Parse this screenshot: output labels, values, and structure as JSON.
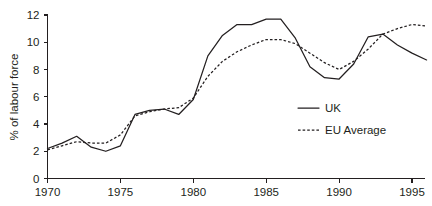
{
  "chart_data": {
    "type": "line",
    "title": "",
    "xlabel": "",
    "ylabel": "% of labour force",
    "xlim": [
      1970,
      1996
    ],
    "ylim": [
      0,
      12
    ],
    "grid": false,
    "legend_position": "center-right",
    "x_ticks": [
      "1970",
      "1975",
      "1980",
      "1985",
      "1990",
      "1995"
    ],
    "x_tick_values": [
      1970,
      1975,
      1980,
      1985,
      1990,
      1995
    ],
    "y_ticks": [
      "0",
      "2",
      "4",
      "6",
      "8",
      "10",
      "12"
    ],
    "y_tick_values": [
      0,
      2,
      4,
      6,
      8,
      10,
      12
    ],
    "x": [
      1970,
      1971,
      1972,
      1973,
      1974,
      1975,
      1976,
      1977,
      1978,
      1979,
      1980,
      1981,
      1982,
      1983,
      1984,
      1985,
      1986,
      1987,
      1988,
      1989,
      1990,
      1991,
      1992,
      1993,
      1994,
      1995,
      1996
    ],
    "series": [
      {
        "name": "UK",
        "style": "solid",
        "values": [
          2.2,
          2.6,
          3.1,
          2.3,
          2.0,
          2.4,
          4.7,
          5.0,
          5.1,
          4.7,
          5.8,
          9.0,
          10.5,
          11.3,
          11.3,
          11.7,
          11.7,
          10.3,
          8.2,
          7.4,
          7.3,
          8.4,
          10.4,
          10.6,
          9.8,
          9.2,
          8.7
        ]
      },
      {
        "name": "EU Average",
        "style": "dashed",
        "values": [
          2.1,
          2.4,
          2.7,
          2.6,
          2.6,
          3.2,
          4.6,
          4.9,
          5.1,
          5.2,
          5.9,
          7.5,
          8.6,
          9.3,
          9.8,
          10.2,
          10.2,
          9.9,
          9.2,
          8.5,
          8.0,
          8.6,
          9.5,
          10.6,
          11.0,
          11.3,
          11.2
        ]
      }
    ]
  },
  "legend": {
    "items": [
      {
        "label": "UK",
        "style": "solid"
      },
      {
        "label": "EU Average",
        "style": "dashed"
      }
    ]
  }
}
